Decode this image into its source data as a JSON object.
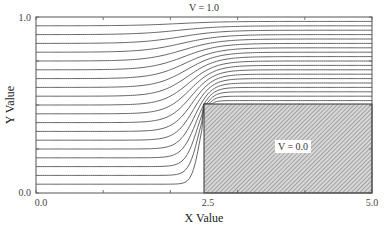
{
  "chart_data": {
    "type": "line",
    "subtype": "contour",
    "title": "",
    "xlabel": "X Value",
    "ylabel": "Y Value",
    "xlim": [
      0.0,
      5.0
    ],
    "ylim": [
      0.0,
      1.0
    ],
    "x_tick_labels": [
      "0.0",
      "2.5",
      "5.0"
    ],
    "y_tick_labels": [
      "0.0",
      "1.0"
    ],
    "x_minor_ticks": [
      0.0,
      1.0,
      2.0,
      3.0,
      4.0,
      5.0
    ],
    "y_minor_ticks": [
      0.0,
      0.25,
      0.5,
      0.75,
      1.0
    ],
    "grid": false,
    "legend": null,
    "contour_levels": [
      0.05,
      0.1,
      0.15,
      0.2,
      0.25,
      0.3,
      0.35,
      0.4,
      0.45,
      0.5,
      0.55,
      0.6,
      0.65,
      0.7,
      0.75,
      0.8,
      0.85,
      0.9,
      0.95
    ],
    "boundary_conditions": {
      "top": {
        "label": "V = 1.0",
        "value": 1.0
      },
      "obstacle": {
        "label": "V = 0.0",
        "value": 0.0,
        "x": [
          2.5,
          5.0
        ],
        "y": [
          0.0,
          0.5
        ],
        "fill": "hatched"
      }
    },
    "annotations": [
      {
        "text": "V = 1.0",
        "x": 2.5,
        "y": 1.0,
        "position": "above-top-axis"
      },
      {
        "text": "V = 0.0",
        "x": 3.75,
        "y": 0.25,
        "position": "inside-obstacle"
      }
    ],
    "colors": {
      "lines": "#555555",
      "axis": "#444444",
      "hatch": "#777777",
      "background": "#ffffff"
    }
  },
  "plot": {
    "x_axis_title": "X Value",
    "y_axis_title": "Y Value",
    "x_ticks": {
      "t0": "0.0",
      "t1": "2.5",
      "t2": "5.0"
    },
    "y_ticks": {
      "t0": "0.0",
      "t1": "1.0"
    },
    "top_label": "V = 1.0",
    "obstacle_label": "V = 0.0"
  }
}
